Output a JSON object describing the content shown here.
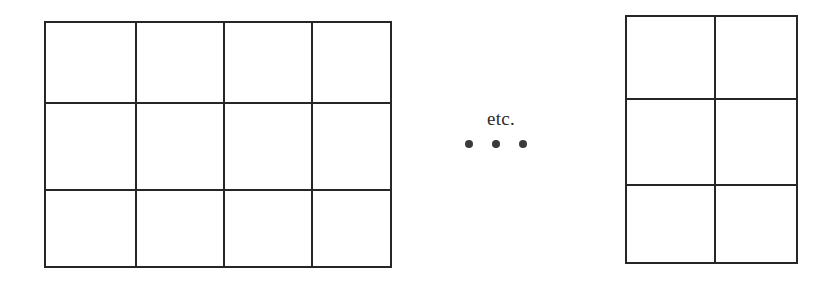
{
  "figure": {
    "background_color": "#ffffff",
    "line_color": "#262626",
    "width": 837,
    "height": 290,
    "annotation": {
      "etc_label": "etc.",
      "ellipsis_dots": [
        "•",
        "•",
        "•"
      ],
      "dot_count": 3,
      "dot_color": "#3a3a3a"
    },
    "grids": [
      {
        "name": "left-grid",
        "columns": 4,
        "rows": 3,
        "cell_count": 12,
        "x": 44,
        "y": 21,
        "width": 348,
        "height": 247,
        "cells": [
          "",
          "",
          "",
          "",
          "",
          "",
          "",
          "",
          "",
          "",
          "",
          ""
        ]
      },
      {
        "name": "right-grid",
        "columns": 2,
        "rows": 3,
        "cell_count": 6,
        "x": 625,
        "y": 15,
        "width": 173,
        "height": 249,
        "cells": [
          "",
          "",
          "",
          "",
          "",
          ""
        ]
      }
    ]
  }
}
